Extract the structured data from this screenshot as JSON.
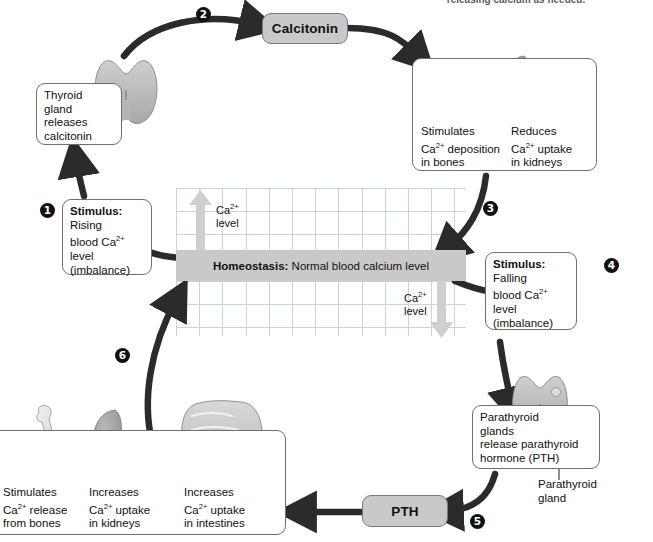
{
  "figure": {
    "cut_off_caption": "releasing calcium as needed."
  },
  "homeostasis": {
    "bold": "Homeostasis:",
    "rest": " Normal blood calcium level",
    "ca_up_label": "Ca2+\nlevel",
    "ca_down_label": "Ca2+\nlevel"
  },
  "steps": [
    {
      "num": "1"
    },
    {
      "num": "2"
    },
    {
      "num": "3"
    },
    {
      "num": "4"
    },
    {
      "num": "5"
    },
    {
      "num": "6"
    }
  ],
  "boxes": {
    "thyroid_release": "Thyroid\ngland\nreleases\ncalcitonin",
    "stimulus_rising_bold": "Stimulus:",
    "stimulus_rising_rest": "\nRising\nblood Ca2+\nlevel\n(imbalance)",
    "stimulus_falling_bold": "Stimulus:",
    "stimulus_falling_rest": "\nFalling\nblood Ca2+\nlevel\n(imbalance)",
    "parathyroid_release": "Parathyroid\nglands\nrelease parathyroid\nhormone (PTH)",
    "calcitonin_effect_bone": "Stimulates\nCa2+ deposition\nin bones",
    "calcitonin_effect_kidney": "Reduces\nCa2+ uptake\nin kidneys",
    "pth_effect_bone": "Stimulates\nCa2+ release\nfrom bones",
    "pth_effect_kidney": "Increases\nCa2+ uptake\nin kidneys",
    "pth_effect_intestine": "Increases\nCa2+ uptake\nin intestines"
  },
  "hormones": {
    "calcitonin": "Calcitonin",
    "pth": "PTH"
  },
  "annotations": {
    "parathyroid_gland": "Parathyroid\ngland"
  },
  "colors": {
    "pill_fill": "#c9c9c9",
    "band_fill": "#c9c9c9",
    "grid_line": "#c5d4e2",
    "arrow_dark": "#2b2b2b",
    "pale_arrow": "#cfcfcf",
    "organ_gray": "#b4b4b4",
    "box_border": "#6f6f6f"
  }
}
